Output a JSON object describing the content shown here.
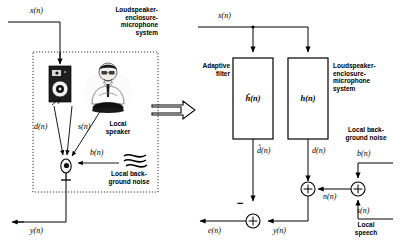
{
  "diagram": {
    "left_panel": {
      "system_label": "Loudspeaker-\nenclosure-\nmicrophone\nsystem",
      "input_signal": "x(n)",
      "output_signal": "y(n)",
      "echo_path_signal": "d(n)",
      "speech_signal": "s(n)",
      "noise_signal": "b(n)",
      "speaker_person_label": "Local\nspeaker",
      "noise_source_label": "Local back-\nground noise",
      "icons": {
        "loudspeaker": "loudspeaker-icon",
        "person": "local-speaker-person-icon",
        "microphone": "microphone-icon",
        "noise_waves": "noise-waves-icon",
        "enclosure": "dotted-enclosure-boundary"
      }
    },
    "transition_arrow": "block-arrow-right",
    "right_panel": {
      "input_signal": "x(n)",
      "adaptive_filter_label": "Adaptive\nfilter",
      "adaptive_filter_transfer": "ĥ(n)",
      "system_label": "Loudspeaker-\nenclosure-\nmicrophone\nsystem",
      "system_transfer": "h(n)",
      "estimated_echo": "d̂(n)",
      "echo_signal": "d(n)",
      "noise_label": "Local back-\nground noise",
      "noise_signal": "b(n)",
      "speech_signal": "s(n)",
      "speech_label": "Local\nspeech",
      "combined_noise": "n(n)",
      "mic_output": "y(n)",
      "error_signal": "e(n)",
      "minus_sign": "−",
      "summing_junctions": [
        "sum-junction-mic",
        "sum-junction-noise-speech",
        "sum-junction-error"
      ]
    },
    "colors": {
      "line": "#000000",
      "background": "#ffffff",
      "speaker_body": "#1a1a1a",
      "dotted_border": "#333333"
    }
  }
}
